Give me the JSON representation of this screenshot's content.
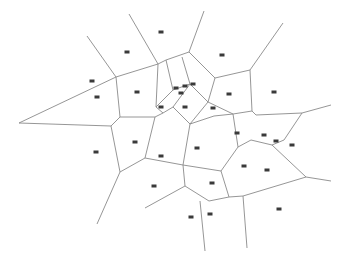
{
  "diagram": {
    "type": "voronoi",
    "width": 347,
    "height": 265,
    "edge_color": "#8a8a8a",
    "site_color": "#3a3a3a",
    "edges": [
      [
        [
          87,
          36
        ],
        [
          116,
          77
        ]
      ],
      [
        [
          129,
          14
        ],
        [
          158,
          64
        ]
      ],
      [
        [
          116,
          77
        ],
        [
          158,
          64
        ]
      ],
      [
        [
          116,
          77
        ],
        [
          120,
          117
        ]
      ],
      [
        [
          158,
          64
        ],
        [
          156,
          107
        ]
      ],
      [
        [
          120,
          117
        ],
        [
          155,
          117
        ]
      ],
      [
        [
          19,
          123
        ],
        [
          116,
          77
        ]
      ],
      [
        [
          19,
          123
        ],
        [
          111,
          126
        ]
      ],
      [
        [
          111,
          126
        ],
        [
          120,
          117
        ]
      ],
      [
        [
          158,
          64
        ],
        [
          166,
          60
        ],
        [
          189,
          52
        ]
      ],
      [
        [
          166,
          60
        ],
        [
          173,
          90
        ]
      ],
      [
        [
          182,
          57
        ],
        [
          190,
          84
        ]
      ],
      [
        [
          204,
          11
        ],
        [
          189,
          52
        ]
      ],
      [
        [
          189,
          52
        ],
        [
          215,
          78
        ]
      ],
      [
        [
          215,
          78
        ],
        [
          250,
          70
        ]
      ],
      [
        [
          283,
          23
        ],
        [
          250,
          70
        ]
      ],
      [
        [
          250,
          70
        ],
        [
          252,
          111
        ]
      ],
      [
        [
          215,
          78
        ],
        [
          208,
          102
        ]
      ],
      [
        [
          173,
          90
        ],
        [
          190,
          84
        ]
      ],
      [
        [
          190,
          84
        ],
        [
          208,
          102
        ]
      ],
      [
        [
          156,
          107
        ],
        [
          173,
          90
        ]
      ],
      [
        [
          156,
          107
        ],
        [
          163,
          113
        ],
        [
          155,
          117
        ]
      ],
      [
        [
          163,
          113
        ],
        [
          173,
          107
        ],
        [
          190,
          84
        ]
      ],
      [
        [
          173,
          107
        ],
        [
          190,
          124
        ]
      ],
      [
        [
          190,
          124
        ],
        [
          208,
          102
        ]
      ],
      [
        [
          208,
          102
        ],
        [
          233,
          114
        ],
        [
          252,
          111
        ]
      ],
      [
        [
          252,
          111
        ],
        [
          256,
          115
        ],
        [
          302,
          113
        ],
        [
          331,
          105
        ]
      ],
      [
        [
          302,
          113
        ],
        [
          284,
          140
        ]
      ],
      [
        [
          190,
          124
        ],
        [
          214,
          116
        ],
        [
          233,
          114
        ]
      ],
      [
        [
          155,
          117
        ],
        [
          145,
          158
        ]
      ],
      [
        [
          145,
          158
        ],
        [
          120,
          172
        ]
      ],
      [
        [
          145,
          158
        ],
        [
          183,
          165
        ]
      ],
      [
        [
          120,
          172
        ],
        [
          97,
          224
        ]
      ],
      [
        [
          120,
          172
        ],
        [
          111,
          126
        ]
      ],
      [
        [
          183,
          165
        ],
        [
          190,
          124
        ]
      ],
      [
        [
          183,
          165
        ],
        [
          221,
          171
        ]
      ],
      [
        [
          233,
          114
        ],
        [
          238,
          147
        ]
      ],
      [
        [
          221,
          171
        ],
        [
          238,
          147
        ]
      ],
      [
        [
          238,
          147
        ],
        [
          251,
          140
        ],
        [
          272,
          145
        ]
      ],
      [
        [
          272,
          145
        ],
        [
          284,
          140
        ]
      ],
      [
        [
          272,
          145
        ],
        [
          306,
          177
        ],
        [
          331,
          181
        ]
      ],
      [
        [
          221,
          171
        ],
        [
          229,
          197
        ]
      ],
      [
        [
          306,
          177
        ],
        [
          243,
          196
        ],
        [
          229,
          197
        ]
      ],
      [
        [
          183,
          165
        ],
        [
          185,
          186
        ]
      ],
      [
        [
          185,
          186
        ],
        [
          209,
          201
        ],
        [
          229,
          197
        ]
      ],
      [
        [
          185,
          186
        ],
        [
          145,
          208
        ]
      ],
      [
        [
          200,
          201
        ],
        [
          205,
          251
        ]
      ],
      [
        [
          243,
          196
        ],
        [
          247,
          248
        ]
      ]
    ],
    "sites": [
      [
        161,
        32
      ],
      [
        127,
        52
      ],
      [
        222,
        55
      ],
      [
        92,
        81
      ],
      [
        97,
        97
      ],
      [
        137,
        92
      ],
      [
        176,
        88
      ],
      [
        185,
        86
      ],
      [
        193,
        84
      ],
      [
        181,
        93
      ],
      [
        229,
        94
      ],
      [
        274,
        92
      ],
      [
        161,
        107
      ],
      [
        213,
        108
      ],
      [
        185,
        107
      ],
      [
        96,
        152
      ],
      [
        135,
        142
      ],
      [
        161,
        156
      ],
      [
        197,
        148
      ],
      [
        237,
        133
      ],
      [
        264,
        135
      ],
      [
        276,
        141
      ],
      [
        292,
        145
      ],
      [
        244,
        166
      ],
      [
        212,
        183
      ],
      [
        267,
        170
      ],
      [
        154,
        186
      ],
      [
        191,
        217
      ],
      [
        210,
        214
      ],
      [
        279,
        209
      ]
    ]
  }
}
